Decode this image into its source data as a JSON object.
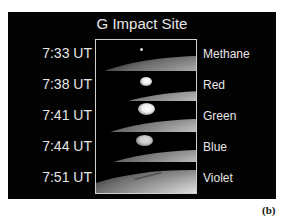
{
  "figure": {
    "title": "G Impact Site",
    "panel_label": "(b)",
    "rows": [
      {
        "time": "7:33 UT",
        "filter": "Methane"
      },
      {
        "time": "7:38 UT",
        "filter": "Red"
      },
      {
        "time": "7:41 UT",
        "filter": "Green"
      },
      {
        "time": "7:44 UT",
        "filter": "Blue"
      },
      {
        "time": "7:51 UT",
        "filter": "Violet"
      }
    ]
  }
}
